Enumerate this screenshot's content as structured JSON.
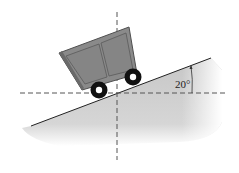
{
  "diagram": {
    "angle_label": "20°",
    "colors": {
      "ground": "#c9c9c9",
      "cart_body": "#8a8a8a",
      "cart_frame": "#5a5a5a",
      "wheel": "#111111",
      "dashed_axes": "#555555",
      "incline_line": "#222222"
    }
  }
}
